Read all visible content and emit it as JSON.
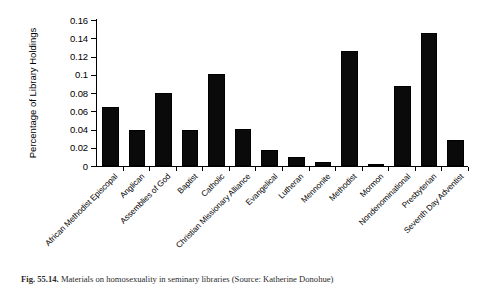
{
  "figure": {
    "caption_number": "Fig. 55.14.",
    "caption_text": "Materials on homosexuality in seminary libraries (Source: Katherine Donohue)"
  },
  "chart_data": {
    "type": "bar",
    "title": "",
    "xlabel": "",
    "ylabel": "Percentage of Library Holdings",
    "ylim": [
      0,
      0.16
    ],
    "ytick_labels": [
      "0",
      "0.02",
      "0.04",
      "0.06",
      "0.08",
      "0.1",
      "0.12",
      "0.14",
      "0.16"
    ],
    "ytick_values": [
      0,
      0.02,
      0.04,
      0.06,
      0.08,
      0.1,
      0.12,
      0.14,
      0.16
    ],
    "grid": false,
    "legend": "none",
    "bar_color": "#0a0a0a",
    "categories": [
      "African Methodist Episcopal",
      "Anglican",
      "Assemblies of God",
      "Baptist",
      "Catholic",
      "Christian Missionary Alliance",
      "Evangelical",
      "Lutheran",
      "Mennonite",
      "Methodist",
      "Mormon",
      "Nondenominational",
      "Presbyterian",
      "Seventh Day Adventist"
    ],
    "values": [
      0.065,
      0.04,
      0.08,
      0.04,
      0.101,
      0.041,
      0.018,
      0.01,
      0.004,
      0.126,
      0.002,
      0.088,
      0.146,
      0.029
    ]
  }
}
